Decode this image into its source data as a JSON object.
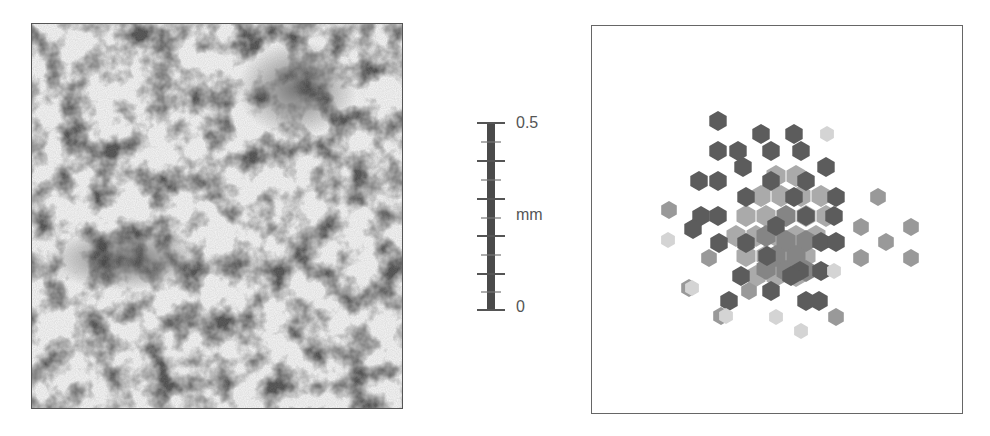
{
  "scale_bar": {
    "top_label": "0.5",
    "unit_label": "mm",
    "bottom_label": "0",
    "major_ticks": 6,
    "minor_ticks": 5
  },
  "left_panel": {
    "description": "grayscale texture image"
  },
  "right_panel": {
    "description": "hexagonal intensity map"
  },
  "colors": {
    "dark": "#5a5a5a",
    "mid": "#808080",
    "light": "#a8a8a8",
    "faint": "#d2d2d2",
    "frame": "#555555"
  }
}
